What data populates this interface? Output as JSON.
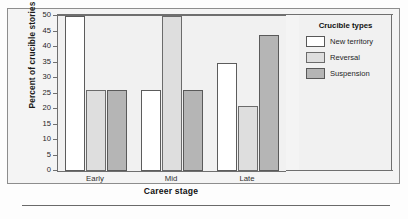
{
  "chart_data": {
    "type": "bar",
    "title": "",
    "xlabel": "Career stage",
    "ylabel": "Percent of crucible stories",
    "categories": [
      "Early",
      "Mid",
      "Late"
    ],
    "series": [
      {
        "name": "New territory",
        "values": [
          50,
          26,
          35
        ],
        "color": "#ffffff"
      },
      {
        "name": "Reversal",
        "values": [
          26,
          50,
          21
        ],
        "color": "#dedede"
      },
      {
        "name": "Suspension",
        "values": [
          26,
          26,
          44
        ],
        "color": "#b5b5b5"
      }
    ],
    "ylim": [
      0,
      50
    ],
    "ytick_step": 5,
    "yticks": [
      50,
      45,
      40,
      35,
      30,
      25,
      20,
      15,
      10,
      5,
      0
    ],
    "grid": false,
    "legend": {
      "title": "Crucible types",
      "position": "right"
    }
  },
  "axes": {
    "y_title": "Percent of crucible stories",
    "x_title": "Career stage",
    "y_tick_labels": [
      "50",
      "45",
      "40",
      "35",
      "30",
      "25",
      "20",
      "15",
      "10",
      "5",
      "0"
    ],
    "x_tick_labels": [
      "Early",
      "Mid",
      "Late"
    ]
  },
  "legend": {
    "title": "Crucible types",
    "entries": [
      {
        "label": "New territory",
        "swatch": "white-swatch"
      },
      {
        "label": "Reversal",
        "swatch": "light-gray-swatch"
      },
      {
        "label": "Suspension",
        "swatch": "dark-gray-swatch"
      }
    ]
  },
  "colors": {
    "new_territory": "#ffffff",
    "reversal": "#dedede",
    "suspension": "#b5b5b5",
    "axis": "#6f6f6f",
    "frame": "#8d8d8d",
    "plot_background": "#f1f1f1",
    "figure_background": "#f4f4f4"
  }
}
